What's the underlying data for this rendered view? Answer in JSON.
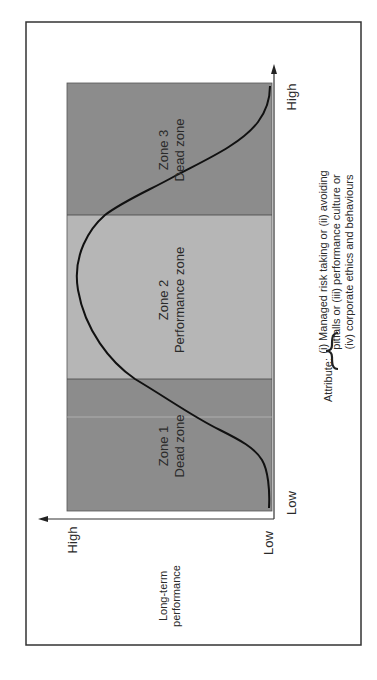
{
  "figure": {
    "y_axis": {
      "title_line1": "Long-term",
      "title_line2": "performance",
      "high_label": "High",
      "low_label": "Low"
    },
    "x_axis": {
      "low_label": "Low",
      "high_label": "High"
    },
    "zones": [
      {
        "id": "zone-1",
        "title": "Zone 1",
        "subtitle": "Dead zone",
        "color": "#8c8c8c"
      },
      {
        "id": "zone-2",
        "title": "Zone 2",
        "subtitle": "Performance zone",
        "color": "#b6b6b6"
      },
      {
        "id": "zone-3",
        "title": "Zone 3",
        "subtitle": "Dead zone",
        "color": "#8c8c8c"
      }
    ],
    "attribute": {
      "label": "Attribute:",
      "lines": [
        "(i) Managed risk taking or (ii) avoiding",
        "pitfalls or (iii) performance culture or",
        "(iv) corporate ethics and behaviours"
      ]
    },
    "curve_color": "#111111",
    "border_color": "#333333"
  }
}
